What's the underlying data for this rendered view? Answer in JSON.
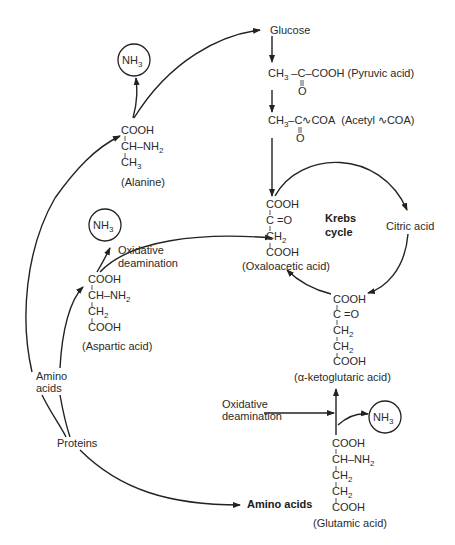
{
  "diagram": {
    "nodes": {
      "glucose": "Glucose",
      "pyruvic": {
        "left": "CH",
        "sub": "3",
        "formula": "–C–COOH",
        "carbonyl": "O",
        "name": "(Pyruvic acid)"
      },
      "acetyl": {
        "left": "CH",
        "sub": "3",
        "formula": "–C∿COA",
        "carbonyl": "O",
        "name": "(Acetyl ∿COA)"
      },
      "krebs": {
        "line1": "Krebs",
        "line2": "cycle"
      },
      "citric": "Citric acid",
      "oxaloacetic": {
        "l1": "COOH",
        "l2": "C =O",
        "l3": "CH",
        "l3sub": "2",
        "l4": "COOH",
        "name": "(Oxaloacetic acid)"
      },
      "ketoglutaric": {
        "l1": "COOH",
        "l2": "C =O",
        "l3": "CH",
        "l3sub": "2",
        "l4": "CH",
        "l4sub": "2",
        "l5": "COOH",
        "name": "(α-ketoglutaric acid)"
      },
      "alanine": {
        "l1": "COOH",
        "l2": "CH–NH",
        "l2sub": "2",
        "l3": "CH",
        "l3sub": "3",
        "name": "(Alanine)"
      },
      "aspartic": {
        "l1": "COOH",
        "l2": "CH–NH",
        "l2sub": "2",
        "l3": "CH",
        "l3sub": "2",
        "l4": "COOH",
        "name": "(Aspartic acid)"
      },
      "glutamic": {
        "l1": "COOH",
        "l2": "CH–NH",
        "l2sub": "2",
        "l3": "CH",
        "l3sub": "2",
        "l4": "CH",
        "l4sub": "2",
        "l5": "COOH",
        "name": "(Glutamic acid)"
      },
      "nh3": {
        "base": "NH",
        "sub": "3"
      },
      "oxidative_deamination_1": {
        "l1": "Oxidative",
        "l2": "deamination"
      },
      "oxidative_deamination_2": {
        "l1": "Oxidative",
        "l2": "deamination"
      },
      "amino_acids_left": {
        "l1": "Amino",
        "l2": "acids"
      },
      "proteins": "Proteins",
      "amino_acids_bold": "Amino acids"
    },
    "colors": {
      "line": "#222222",
      "text": "#2a2a2a",
      "background": "#ffffff"
    }
  }
}
